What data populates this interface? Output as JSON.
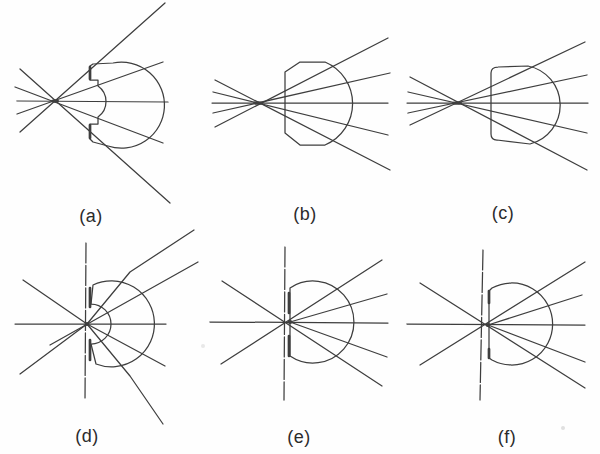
{
  "figure": {
    "background": "#fefefe",
    "stroke_color": "#3e3e3e",
    "stroke_width": 1.25,
    "thick_width": 2.7,
    "label_color": "#2b2b2b",
    "panels": [
      {
        "label": "(a)",
        "label_pos": {
          "x": 91,
          "y": 216
        },
        "focus": {
          "x": 55,
          "y": 101
        },
        "focus_dot": {
          "rx": 4,
          "ry": 1.7
        },
        "rays": [
          {
            "points": [
              [
                17,
                101
              ],
              [
                168,
                102
              ]
            ],
            "dashed": false
          },
          {
            "points": [
              [
                15,
                87
              ],
              [
                163,
                143
              ]
            ],
            "dashed": false
          },
          {
            "points": [
              [
                17,
                114
              ],
              [
                163,
                62
              ]
            ],
            "dashed": false
          },
          {
            "points": [
              [
                20,
                69
              ],
              [
                170,
                203
              ]
            ],
            "dashed": false
          },
          {
            "points": [
              [
                20,
                132
              ],
              [
                165,
                3
              ]
            ],
            "dashed": false
          }
        ],
        "lens_path": "M 113,63 A 43 43 0 1 1 108,146 L 93,142 L 90,139 L 90,124 L 98,124 L 98,117 A 19 19 0 0 0 98,86 L 98,80 L 90,80 L 90,66 L 93,64 Z",
        "thick_segments": [
          [
            90,
            67,
            90,
            79
          ],
          [
            90,
            125,
            90,
            138
          ]
        ]
      },
      {
        "label": "(b)",
        "label_pos": {
          "x": 305,
          "y": 214
        },
        "focus": {
          "x": 258,
          "y": 103
        },
        "focus_dot": {
          "rx": 5,
          "ry": 1.8
        },
        "rays": [
          {
            "points": [
              [
                212,
                103
              ],
              [
                388,
                103
              ]
            ],
            "dashed": false
          },
          {
            "points": [
              [
                215,
                80
              ],
              [
                390,
                170
              ]
            ],
            "dashed": false
          },
          {
            "points": [
              [
                213,
                92
              ],
              [
                388,
                135
              ]
            ],
            "dashed": false
          },
          {
            "points": [
              [
                213,
                113
              ],
              [
                390,
                73
              ]
            ],
            "dashed": false
          },
          {
            "points": [
              [
                215,
                127
              ],
              [
                388,
                38
              ]
            ],
            "dashed": false
          }
        ],
        "lens_path": "M 285,72 L 300,62 L 325,62 A 45 45 0 0 1 325,145 L 300,145 L 285,133 Z",
        "thick_segments": []
      },
      {
        "label": "(c)",
        "label_pos": {
          "x": 503,
          "y": 213
        },
        "focus": {
          "x": 457,
          "y": 103
        },
        "focus_dot": {
          "rx": 5,
          "ry": 1.8
        },
        "rays": [
          {
            "points": [
              [
                407,
                103
              ],
              [
                588,
                103
              ]
            ],
            "dashed": false
          },
          {
            "points": [
              [
                410,
                77
              ],
              [
                587,
                170
              ]
            ],
            "dashed": false
          },
          {
            "points": [
              [
                408,
                92
              ],
              [
                587,
                133
              ]
            ],
            "dashed": false
          },
          {
            "points": [
              [
                408,
                113
              ],
              [
                587,
                75
              ]
            ],
            "dashed": false
          },
          {
            "points": [
              [
                410,
                125
              ],
              [
                585,
                42
              ]
            ],
            "dashed": false
          }
        ],
        "lens_path": "M 491,73 Q 491,67 498,67 L 528,66 A 40 40 0 0 1 530,144 L 497,140 Q 491,140 491,134 Z",
        "thick_segments": []
      },
      {
        "label": "(d)",
        "label_pos": {
          "x": 87,
          "y": 436
        },
        "focus": {
          "x": 87,
          "y": 324
        },
        "focus_dot": {
          "rx": 2.4,
          "ry": 2
        },
        "rays": [
          {
            "points": [
              [
                15,
                324
              ],
              [
                166,
                324
              ]
            ],
            "dashed": false
          },
          {
            "points": [
              [
                86,
                243
              ],
              [
                85,
                400
              ]
            ],
            "dashed": true
          },
          {
            "points": [
              [
                20,
                374
              ],
              [
                87,
                324
              ],
              [
                130,
                272
              ],
              [
                194,
                230
              ]
            ],
            "dashed": false
          },
          {
            "points": [
              [
                50,
                345
              ],
              [
                198,
                262
              ]
            ],
            "dashed": false
          },
          {
            "points": [
              [
                23,
                280
              ],
              [
                87,
                324
              ],
              [
                165,
                366
              ]
            ],
            "dashed": false
          },
          {
            "points": [
              [
                87,
                324
              ],
              [
                130,
                376
              ],
              [
                163,
                424
              ]
            ],
            "dashed": false
          }
        ],
        "lens_path": "M 93,285 A 43 43 0 1 1 96,364 L 91,344 A 20 20 0 0 0 91,304 Z",
        "thick_segments": [
          [
            90,
            288,
            90,
            307
          ],
          [
            90,
            340,
            90,
            360
          ]
        ]
      },
      {
        "label": "(e)",
        "label_pos": {
          "x": 299,
          "y": 437
        },
        "focus": {
          "x": 290,
          "y": 322
        },
        "focus_dot": {
          "rx": 2.4,
          "ry": 2
        },
        "rays": [
          {
            "points": [
              [
                210,
                322
              ],
              [
                388,
                323
              ]
            ],
            "dashed": false
          },
          {
            "points": [
              [
                285,
                247
              ],
              [
                284,
                400
              ]
            ],
            "dashed": true
          },
          {
            "points": [
              [
                221,
                364
              ],
              [
                382,
                260
              ]
            ],
            "dashed": false
          },
          {
            "points": [
              [
                222,
                281
              ],
              [
                382,
                386
              ]
            ],
            "dashed": false
          },
          {
            "points": [
              [
                290,
                322
              ],
              [
                387,
                294
              ]
            ],
            "dashed": false
          },
          {
            "points": [
              [
                290,
                322
              ],
              [
                387,
                357
              ]
            ],
            "dashed": false
          }
        ],
        "lens_path": "M 290,288 A 41 41 0 1 1 290,356 Z",
        "thick_segments": [
          [
            289,
            293,
            289,
            313
          ],
          [
            289,
            336,
            289,
            356
          ]
        ]
      },
      {
        "label": "(f)",
        "label_pos": {
          "x": 507,
          "y": 437
        },
        "focus": {
          "x": 488,
          "y": 325
        },
        "focus_dot": {
          "rx": 2.4,
          "ry": 2
        },
        "rays": [
          {
            "points": [
              [
                407,
                324
              ],
              [
                585,
                325
              ]
            ],
            "dashed": false
          },
          {
            "points": [
              [
                483,
                250
              ],
              [
                480,
                400
              ]
            ],
            "dashed": true
          },
          {
            "points": [
              [
                420,
                365
              ],
              [
                585,
                262
              ]
            ],
            "dashed": false
          },
          {
            "points": [
              [
                420,
                283
              ],
              [
                585,
                388
              ]
            ],
            "dashed": false
          },
          {
            "points": [
              [
                488,
                325
              ],
              [
                582,
                295
              ]
            ],
            "dashed": false
          },
          {
            "points": [
              [
                488,
                325
              ],
              [
                585,
                362
              ]
            ],
            "dashed": false
          }
        ],
        "lens_path": "M 492,288 A 41 41 0 1 1 492,360 L 489,358 L 489,291 Z",
        "thick_segments": [
          [
            489,
            291,
            489,
            303
          ],
          [
            489,
            349,
            489,
            358
          ]
        ]
      }
    ],
    "artifacts": [
      {
        "x": 563,
        "y": 428,
        "r": 2,
        "color": "#c6c6c6"
      },
      {
        "x": 203,
        "y": 346,
        "r": 2,
        "color": "#d6d6d6"
      }
    ]
  }
}
